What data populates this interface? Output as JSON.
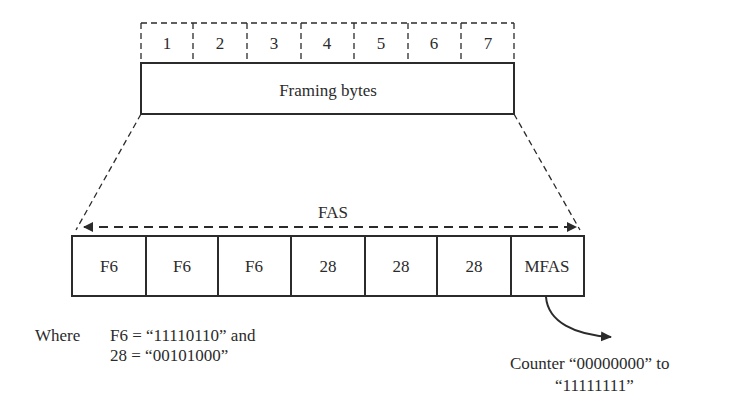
{
  "diagram": {
    "framing": {
      "byte_numbers": [
        "1",
        "2",
        "3",
        "4",
        "5",
        "6",
        "7"
      ],
      "label": "Framing bytes"
    },
    "fas": {
      "label": "FAS",
      "cells": [
        "F6",
        "F6",
        "F6",
        "28",
        "28",
        "28",
        "MFAS"
      ]
    },
    "notes": {
      "where_label": "Where",
      "line1": "F6 = “11110110” and",
      "line2": "28 = “00101000”"
    },
    "counter": {
      "line1": "Counter “00000000” to",
      "line2": "“11111111”"
    },
    "colors": {
      "stroke": "#2b2b2b",
      "background": "#ffffff"
    }
  }
}
